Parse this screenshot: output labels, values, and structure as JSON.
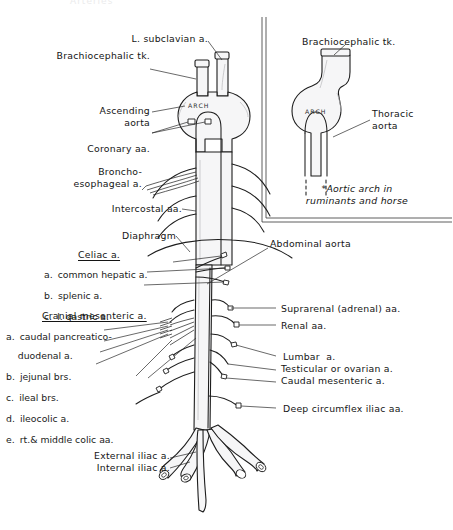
{
  "figure": {
    "title_cutoff": "Arteries",
    "center_label_arch": "ARCH",
    "inset_label_arch": "ARCH"
  },
  "main_diagram": {
    "labels_left": [
      {
        "name": "l-subclavian",
        "text": "L. subclavian a."
      },
      {
        "name": "brachiocephalic-trunk",
        "text": "Brachiocephalic tk."
      },
      {
        "name": "ascending-aorta",
        "text": "Ascending\naorta"
      },
      {
        "name": "coronary-aa",
        "text": "Coronary aa."
      },
      {
        "name": "broncho-esophageal",
        "text": "Broncho-\nesophageal a."
      },
      {
        "name": "intercostal-aa",
        "text": "Intercostal aa."
      },
      {
        "name": "diaphragm",
        "text": "Diaphragm"
      }
    ],
    "celiac_group": {
      "heading": "Celiac a.",
      "items": [
        {
          "key": "a.",
          "text": "common hepatic a."
        },
        {
          "key": "b.",
          "text": "splenic a."
        },
        {
          "key": "c.",
          "text": "l. gastric a."
        }
      ]
    },
    "cranial_mesenteric_group": {
      "heading": "Cranial mesenteric a.",
      "items": [
        {
          "key": "a.",
          "text": "caudal pancreatico-\n    duodenal a."
        },
        {
          "key": "b.",
          "text": "jejunal brs."
        },
        {
          "key": "c.",
          "text": "ileal brs."
        },
        {
          "key": "d.",
          "text": "ileocolic a."
        },
        {
          "key": "e.",
          "text": "rt.& middle colic aa."
        }
      ]
    },
    "labels_right": [
      {
        "name": "abdominal-aorta",
        "text": "Abdominal aorta"
      },
      {
        "name": "suprarenal-aa",
        "text": "Suprarenal (adrenal) aa."
      },
      {
        "name": "renal-aa",
        "text": "Renal aa."
      },
      {
        "name": "lumbar-a",
        "text": "Lumbar  a."
      },
      {
        "name": "testicular-ovarian-a",
        "text": "Testicular or ovarian a."
      },
      {
        "name": "caudal-mesenteric-a",
        "text": "Caudal mesenteric a."
      },
      {
        "name": "deep-circumflex-iliac-aa",
        "text": "Deep circumflex iliac aa."
      }
    ],
    "labels_bottom": [
      {
        "name": "external-iliac-a",
        "text": "External iliac a."
      },
      {
        "name": "internal-iliac-a",
        "text": "Internal iliac a."
      }
    ]
  },
  "inset": {
    "brachiocephalic_trunk": "Brachiocephalic tk.",
    "thoracic_aorta": "Thoracic\naorta",
    "note": "*Aortic arch in\nruminants and horse"
  },
  "colors": {
    "ink": "#141414",
    "vessel_fill": "#f6f6f7",
    "vessel_stroke": "#1d1d1d",
    "leader": "#2a2a2a",
    "inset_border": "#4a4a4a"
  }
}
